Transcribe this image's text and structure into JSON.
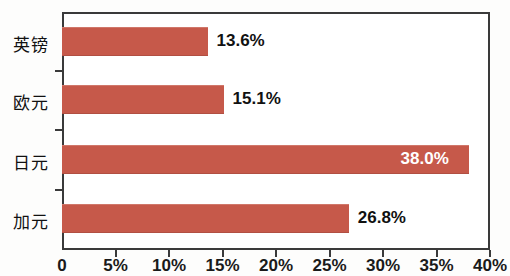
{
  "chart": {
    "type": "bar",
    "orientation": "horizontal",
    "bar_color": "#c6594a",
    "frame_color": "#3a3a3a",
    "background": "#ffffff"
  },
  "chart_data": {
    "type": "bar",
    "title": "",
    "xlabel": "",
    "ylabel": "",
    "categories": [
      "英镑",
      "欧元",
      "日元",
      "加元"
    ],
    "values": [
      13.6,
      15.1,
      38.0,
      26.8
    ],
    "value_labels": [
      "13.6%",
      "15.1%",
      "38.0%",
      "26.8%"
    ],
    "label_placement": [
      "outside",
      "outside",
      "inside",
      "outside"
    ],
    "xlim": [
      0,
      40
    ],
    "xticks": [
      0,
      5,
      10,
      15,
      20,
      25,
      30,
      35,
      40
    ],
    "xtick_labels": [
      "0",
      "5%",
      "10%",
      "15%",
      "20%",
      "25%",
      "30%",
      "35%",
      "40%"
    ],
    "grid": false,
    "legend": null,
    "series": [
      {
        "name": "",
        "values": [
          13.6,
          15.1,
          38.0,
          26.8
        ]
      }
    ]
  }
}
